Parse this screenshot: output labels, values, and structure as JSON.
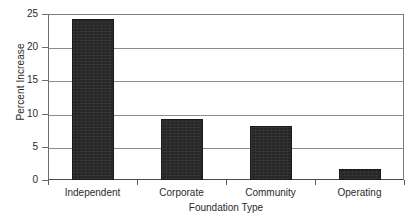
{
  "chart_data": {
    "type": "bar",
    "title": "",
    "categories": [
      "Independent",
      "Corporate",
      "Community",
      "Operating"
    ],
    "values": [
      24.3,
      9.2,
      8.1,
      1.6
    ],
    "xlabel": "Foundation Type",
    "ylabel": "Percent Increase",
    "ylim": [
      0,
      25
    ],
    "ytick_labels": [
      "25",
      "20",
      "15",
      "10",
      "5",
      "0"
    ],
    "ytick_values": [
      25,
      20,
      15,
      10,
      5,
      0
    ],
    "grid": "horizontal",
    "legend": "none",
    "bar_color": "#262626",
    "gridline_color": "#8d8d8d",
    "axis_color": "#5a5a5a",
    "background_color": "#ffffff"
  }
}
